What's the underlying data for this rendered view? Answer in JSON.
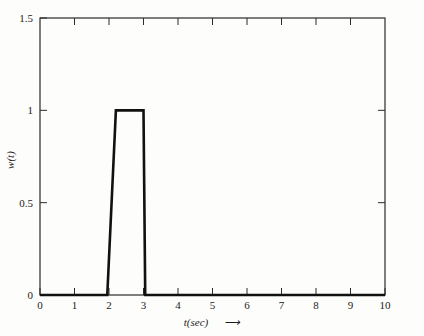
{
  "chart_data": {
    "type": "line",
    "title": "",
    "subtitle": "",
    "xlabel": "t(sec)",
    "xlabel_arrow": "⟶",
    "ylabel": "w(t)",
    "xlim": [
      0,
      10
    ],
    "ylim": [
      0,
      1.5
    ],
    "grid": false,
    "legend": null,
    "xticks": [
      0,
      1,
      2,
      3,
      4,
      5,
      6,
      7,
      8,
      9,
      10
    ],
    "xtick_labels": [
      "0",
      "1",
      "2",
      "3",
      "4",
      "5",
      "6",
      "7",
      "8",
      "9",
      "10"
    ],
    "yticks": [
      0,
      0.5,
      1,
      1.5
    ],
    "ytick_labels": [
      "0",
      "0.5",
      "1",
      "1.5"
    ],
    "series": [
      {
        "name": "w(t)",
        "color": "#111111",
        "x": [
          0,
          1.95,
          2.2,
          3.0,
          3.05,
          10
        ],
        "y": [
          0,
          0,
          1,
          1,
          0,
          0
        ]
      }
    ],
    "annotations": []
  },
  "axes": {
    "frame_color": "#2b2b2b",
    "tick_direction": "in",
    "background": "#fdfdfb"
  }
}
